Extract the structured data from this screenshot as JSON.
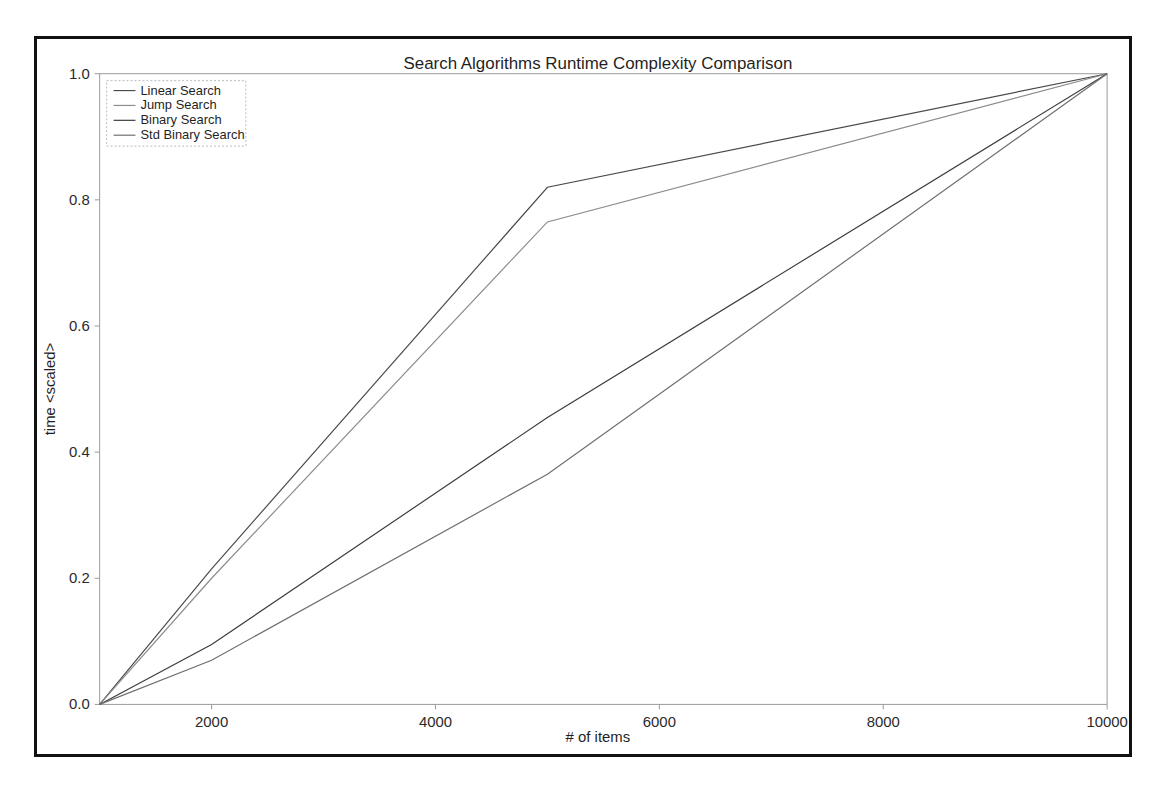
{
  "figure": {
    "title": "Search Algorithms Runtime Complexity Comparison",
    "frame_border_color": "#111111",
    "background_color": "#ffffff"
  },
  "axes": {
    "xlabel": "# of items",
    "ylabel": "time <scaled>",
    "x_ticks": [
      "2000",
      "4000",
      "6000",
      "8000",
      "10000"
    ],
    "y_ticks": [
      "0.0",
      "0.2",
      "0.4",
      "0.6",
      "0.8",
      "1.0"
    ],
    "axis_color": "#9a9a9a"
  },
  "legend": {
    "position": "upper left",
    "entries": [
      {
        "label": "Linear Search",
        "color": "#4a4a4a"
      },
      {
        "label": "Jump Search",
        "color": "#8c8c8c"
      },
      {
        "label": "Binary Search",
        "color": "#3d3d3d"
      },
      {
        "label": "Std Binary Search",
        "color": "#6f6f6f"
      }
    ]
  },
  "chart_data": {
    "type": "line",
    "title": "Search Algorithms Runtime Complexity Comparison",
    "xlabel": "# of items",
    "ylabel": "time <scaled>",
    "xlim": [
      1000,
      10000
    ],
    "ylim": [
      0.0,
      1.0
    ],
    "xticks": [
      2000,
      4000,
      6000,
      8000,
      10000
    ],
    "yticks": [
      0.0,
      0.2,
      0.4,
      0.6,
      0.8,
      1.0
    ],
    "grid": false,
    "legend_position": "upper left",
    "x": [
      1000,
      2000,
      5000,
      10000
    ],
    "series": [
      {
        "name": "Linear Search",
        "color": "#4a4a4a",
        "values": [
          0.0,
          0.215,
          0.82,
          1.0
        ]
      },
      {
        "name": "Jump Search",
        "color": "#8c8c8c",
        "values": [
          0.0,
          0.2,
          0.765,
          1.0
        ]
      },
      {
        "name": "Binary Search",
        "color": "#3d3d3d",
        "values": [
          0.0,
          0.095,
          0.455,
          1.0
        ]
      },
      {
        "name": "Std Binary Search",
        "color": "#6f6f6f",
        "values": [
          0.0,
          0.07,
          0.365,
          1.0
        ]
      }
    ]
  }
}
